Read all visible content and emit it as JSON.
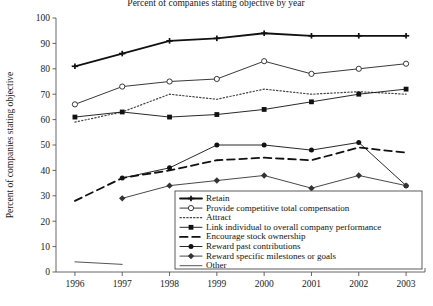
{
  "chart_data": {
    "type": "line",
    "title": "Percent of companies stating objective by year",
    "xlabel": "",
    "ylabel": "Percent of companies stating objective",
    "categories": [
      "1996",
      "1997",
      "1998",
      "1999",
      "2000",
      "2001",
      "2002",
      "2003"
    ],
    "x": [
      1996,
      1997,
      1998,
      1999,
      2000,
      2001,
      2002,
      2003
    ],
    "xlim": [
      1995.6,
      2003.4
    ],
    "ylim": [
      0,
      100
    ],
    "ytick_labels": [
      "0",
      "10",
      "20",
      "30",
      "40",
      "50",
      "60",
      "70",
      "80",
      "90",
      "100"
    ],
    "ytick_values": [
      0,
      10,
      20,
      30,
      40,
      50,
      60,
      70,
      80,
      90,
      100
    ],
    "grid": false,
    "legend_position": "lower-center-inside",
    "series": [
      {
        "name": "Retain",
        "marker": "cross",
        "dash": "solid",
        "width": 1.8,
        "color": "#111111",
        "values": [
          81,
          86,
          91,
          92,
          94,
          93,
          93,
          93
        ]
      },
      {
        "name": "Provide competitive total compensation",
        "marker": "circle",
        "dash": "solid",
        "width": 0.9,
        "color": "#222222",
        "values": [
          66,
          73,
          75,
          76,
          83,
          78,
          80,
          82
        ]
      },
      {
        "name": "Attract",
        "marker": "none",
        "dash": "dotted",
        "width": 1.2,
        "color": "#444444",
        "values": [
          59,
          63,
          70,
          68,
          72,
          70,
          71,
          70
        ]
      },
      {
        "name": "Link individual to overall company performance",
        "marker": "square",
        "dash": "solid",
        "width": 0.9,
        "color": "#111111",
        "values": [
          61,
          63,
          61,
          62,
          64,
          67,
          70,
          72
        ]
      },
      {
        "name": "Encourage stock ownership",
        "marker": "none",
        "dash": "dashed",
        "width": 1.8,
        "color": "#111111",
        "values": [
          28,
          37,
          40,
          44,
          45,
          44,
          49,
          47
        ]
      },
      {
        "name": "Reward past contributions",
        "marker": "dot",
        "dash": "solid",
        "width": 0.9,
        "color": "#111111",
        "values": [
          null,
          37,
          41,
          50,
          50,
          48,
          51,
          34
        ]
      },
      {
        "name": "Reward specific milestones or goals",
        "marker": "diamond",
        "dash": "solid",
        "width": 0.9,
        "color": "#333333",
        "values": [
          null,
          29,
          34,
          36,
          38,
          33,
          38,
          34
        ]
      },
      {
        "name": "Other",
        "marker": "none",
        "dash": "solid",
        "width": 1.0,
        "color": "#555555",
        "values": [
          4,
          3,
          null,
          null,
          null,
          null,
          null,
          null
        ]
      }
    ]
  }
}
